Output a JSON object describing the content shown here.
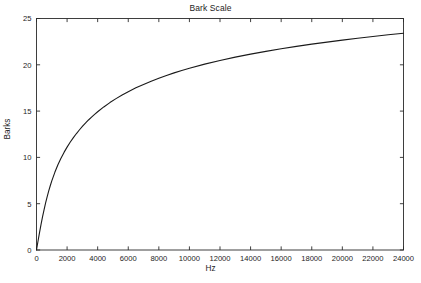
{
  "chart": {
    "title": "Bark Scale",
    "xlabel": "Hz",
    "ylabel": "Barks"
  },
  "chart_data": {
    "type": "line",
    "title": "Bark Scale",
    "xlabel": "Hz",
    "ylabel": "Barks",
    "xlim": [
      0,
      24000
    ],
    "ylim": [
      0,
      25
    ],
    "grid": false,
    "legend": null,
    "xticks": [
      0,
      2000,
      4000,
      6000,
      8000,
      10000,
      12000,
      14000,
      16000,
      18000,
      20000,
      22000,
      24000
    ],
    "xticklabels": [
      "0",
      "2000",
      "4000",
      "6000",
      "8000",
      "10000",
      "12000",
      "14000",
      "16000",
      "18000",
      "20000",
      "22000",
      "24000"
    ],
    "yticks": [
      0,
      5,
      10,
      15,
      20,
      25
    ],
    "yticklabels": [
      "0",
      "5",
      "10",
      "15",
      "20",
      "25"
    ],
    "line_color": "#1a1a1a",
    "line_width": 1.1,
    "series": [
      {
        "name": "Bark Scale",
        "x": [
          0,
          100,
          200,
          300,
          400,
          500,
          600,
          700,
          800,
          900,
          1000,
          1200,
          1400,
          1600,
          1800,
          2000,
          2200,
          2400,
          2600,
          2800,
          3000,
          3200,
          3400,
          3600,
          3800,
          4000,
          4400,
          4800,
          5200,
          5600,
          6000,
          6500,
          7000,
          7500,
          8000,
          8500,
          9000,
          9500,
          10000,
          11000,
          12000,
          13000,
          14000,
          15000,
          16000,
          17000,
          18000,
          19000,
          20000,
          21000,
          22000,
          23000,
          24000
        ],
        "y": [
          0.0,
          0.97,
          1.91,
          2.8,
          3.63,
          4.4,
          5.11,
          5.77,
          6.38,
          6.94,
          7.46,
          8.39,
          9.2,
          9.91,
          10.54,
          11.11,
          11.63,
          12.11,
          12.55,
          12.96,
          13.34,
          13.7,
          14.04,
          14.35,
          14.65,
          14.93,
          15.45,
          15.92,
          16.35,
          16.74,
          17.1,
          17.51,
          17.88,
          18.23,
          18.55,
          18.85,
          19.13,
          19.39,
          19.63,
          20.07,
          20.47,
          20.83,
          21.15,
          21.45,
          21.73,
          21.99,
          22.23,
          22.45,
          22.67,
          22.87,
          23.06,
          23.24,
          23.41
        ]
      }
    ],
    "curve_formula": "Bark = 13*atan(0.00076*f) + 3.5*atan((f/7500)^2)",
    "note": "Curve rises steeply from 0 Barks at 0 Hz and asymptotically approaches ~25 Barks near 24000 Hz"
  }
}
